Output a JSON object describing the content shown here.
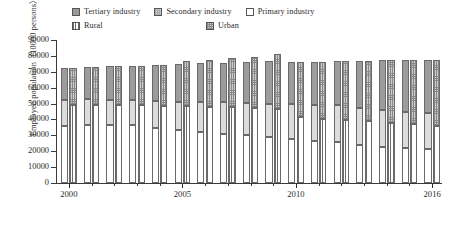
{
  "legend": {
    "rows": [
      [
        {
          "key": "tertiary",
          "label": "Tertiary industry",
          "swatch": "sw-tert"
        },
        {
          "key": "secondary",
          "label": "Secondary industry",
          "swatch": "sw-sec"
        },
        {
          "key": "primary",
          "label": "Primary industry",
          "swatch": "sw-prim"
        }
      ],
      [
        {
          "key": "rural",
          "label": "Rural",
          "swatch": "sw-rural"
        },
        {
          "key": "urban",
          "label": "Urban",
          "swatch": "sw-urban"
        }
      ]
    ]
  },
  "axes": {
    "ylabel": "Employed population（10000 persons）",
    "yticks": [
      0,
      10000,
      20000,
      30000,
      40000,
      50000,
      60000,
      70000,
      80000,
      90000
    ],
    "ylim": [
      0,
      90000
    ],
    "xunit": "（Year）",
    "xtick_labels": [
      "2000",
      "2005",
      "2010",
      "2016"
    ],
    "xlim": [
      2000,
      2016
    ]
  },
  "chart_data": {
    "type": "bar",
    "title": "",
    "subtitle": "",
    "xlabel": "",
    "ylabel": "Employed population（10000 persons）",
    "ylim": [
      0,
      90000
    ],
    "grid": false,
    "legend_position": "top",
    "stacked": true,
    "grouped_bars_per_category": 2,
    "categories": [
      "2000",
      "2001",
      "2002",
      "2003",
      "2004",
      "2005",
      "2006",
      "2007",
      "2008",
      "2009",
      "2010",
      "2011",
      "2012",
      "2013",
      "2014",
      "2015",
      "2016"
    ],
    "bar_group_left": {
      "name": "Industry composition",
      "series": [
        {
          "name": "Primary industry",
          "values": [
            36043,
            36399,
            36640,
            36204,
            34830,
            33442,
            31941,
            30731,
            29923,
            28890,
            27931,
            26594,
            25773,
            24171,
            22790,
            21919,
            21496
          ]
        },
        {
          "name": "Secondary industry",
          "values": [
            16219,
            16234,
            15682,
            15927,
            16709,
            17766,
            18894,
            20186,
            20553,
            21080,
            21842,
            22544,
            23241,
            23170,
            23099,
            22693,
            22350
          ]
        },
        {
          "name": "Tertiary industry",
          "values": [
            19823,
            20165,
            21090,
            21809,
            22725,
            23771,
            24614,
            24917,
            25717,
            27088,
            26332,
            27282,
            27690,
            29636,
            31364,
            32839,
            33757
          ]
        }
      ]
    },
    "bar_group_right": {
      "name": "Urban / Rural split",
      "series": [
        {
          "name": "Rural",
          "values": [
            48934,
            49085,
            48960,
            48793,
            48724,
            48494,
            48090,
            47640,
            47270,
            46875,
            41418,
            40506,
            39602,
            38737,
            37943,
            37041,
            36175
          ]
        },
        {
          "name": "Urban",
          "values": [
            23151,
            23940,
            24452,
            25147,
            25540,
            28485,
            29350,
            30953,
            32103,
            34183,
            34687,
            35914,
            37102,
            38240,
            39310,
            40410,
            41428
          ]
        }
      ]
    },
    "totals": [
      72085,
      73025,
      73412,
      73940,
      74264,
      76979,
      77440,
      78593,
      79373,
      81058,
      76105,
      76420,
      76704,
      76977,
      77253,
      77451,
      77603
    ]
  }
}
